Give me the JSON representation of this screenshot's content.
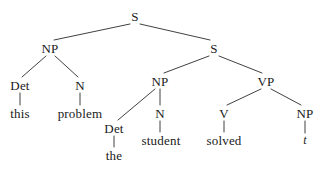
{
  "figure": {
    "type": "phrase-structure-tree",
    "sentence": "this problem the student solved t",
    "line_color": "#2b2b2b",
    "text_color": "#1a1a1a",
    "background_color": "#ffffff"
  },
  "nodes": [
    {
      "id": "s-root",
      "label": "S",
      "kind": "category",
      "x": 135,
      "y": 16
    },
    {
      "id": "np-topic",
      "label": "NP",
      "kind": "category",
      "x": 50,
      "y": 48
    },
    {
      "id": "s-embedded",
      "label": "S",
      "kind": "category",
      "x": 214,
      "y": 48
    },
    {
      "id": "det-this",
      "label": "Det",
      "kind": "category",
      "x": 20,
      "y": 85
    },
    {
      "id": "n-problem",
      "label": "N",
      "kind": "category",
      "x": 80,
      "y": 85
    },
    {
      "id": "np-subject",
      "label": "NP",
      "kind": "category",
      "x": 160,
      "y": 81
    },
    {
      "id": "vp",
      "label": "VP",
      "kind": "category",
      "x": 266,
      "y": 81
    },
    {
      "id": "w-this",
      "label": "this",
      "kind": "word",
      "x": 20,
      "y": 113
    },
    {
      "id": "w-problem",
      "label": "problem",
      "kind": "word",
      "x": 80,
      "y": 113
    },
    {
      "id": "n-student",
      "label": "N",
      "kind": "category",
      "x": 160,
      "y": 113
    },
    {
      "id": "v-solved",
      "label": "V",
      "kind": "category",
      "x": 224,
      "y": 113
    },
    {
      "id": "np-object",
      "label": "NP",
      "kind": "category",
      "x": 305,
      "y": 113
    },
    {
      "id": "det-the",
      "label": "Det",
      "kind": "category",
      "x": 114,
      "y": 128
    },
    {
      "id": "w-student",
      "label": "student",
      "kind": "word",
      "x": 161,
      "y": 140
    },
    {
      "id": "w-solved",
      "label": "solved",
      "kind": "word",
      "x": 224,
      "y": 140
    },
    {
      "id": "w-trace",
      "label": "t",
      "kind": "trace",
      "x": 305,
      "y": 140
    },
    {
      "id": "w-the",
      "label": "the",
      "kind": "word",
      "x": 114,
      "y": 155
    }
  ],
  "edges": [
    {
      "id": "e-root-np",
      "from": "s-root",
      "to": "np-topic",
      "x1": 130,
      "y1": 24,
      "x2": 54,
      "y2": 40
    },
    {
      "id": "e-root-s",
      "from": "s-root",
      "to": "s-embedded",
      "x1": 140,
      "y1": 24,
      "x2": 210,
      "y2": 40
    },
    {
      "id": "e-np-det",
      "from": "np-topic",
      "to": "det-this",
      "x1": 46,
      "y1": 56,
      "x2": 22,
      "y2": 77
    },
    {
      "id": "e-np-n",
      "from": "np-topic",
      "to": "n-problem",
      "x1": 55,
      "y1": 56,
      "x2": 78,
      "y2": 77
    },
    {
      "id": "e-det-this",
      "from": "det-this",
      "to": "w-this",
      "x1": 20,
      "y1": 93,
      "x2": 20,
      "y2": 105
    },
    {
      "id": "e-n-problem",
      "from": "n-problem",
      "to": "w-problem",
      "x1": 80,
      "y1": 93,
      "x2": 80,
      "y2": 105
    },
    {
      "id": "e-s-np",
      "from": "s-embedded",
      "to": "np-subject",
      "x1": 209,
      "y1": 56,
      "x2": 164,
      "y2": 73
    },
    {
      "id": "e-s-vp",
      "from": "s-embedded",
      "to": "vp",
      "x1": 219,
      "y1": 56,
      "x2": 262,
      "y2": 73
    },
    {
      "id": "e-npsubj-det",
      "from": "np-subject",
      "to": "det-the",
      "x1": 155,
      "y1": 89,
      "x2": 118,
      "y2": 120
    },
    {
      "id": "e-npsubj-n",
      "from": "np-subject",
      "to": "n-student",
      "x1": 160,
      "y1": 89,
      "x2": 160,
      "y2": 105
    },
    {
      "id": "e-det-the",
      "from": "det-the",
      "to": "w-the",
      "x1": 114,
      "y1": 136,
      "x2": 114,
      "y2": 147
    },
    {
      "id": "e-n-student",
      "from": "n-student",
      "to": "w-student",
      "x1": 160,
      "y1": 121,
      "x2": 160,
      "y2": 132
    },
    {
      "id": "e-vp-v",
      "from": "vp",
      "to": "v-solved",
      "x1": 261,
      "y1": 89,
      "x2": 227,
      "y2": 105
    },
    {
      "id": "e-vp-np",
      "from": "vp",
      "to": "np-object",
      "x1": 271,
      "y1": 89,
      "x2": 301,
      "y2": 105
    },
    {
      "id": "e-v-solved",
      "from": "v-solved",
      "to": "w-solved",
      "x1": 224,
      "y1": 121,
      "x2": 224,
      "y2": 132
    },
    {
      "id": "e-np-trace",
      "from": "np-object",
      "to": "w-trace",
      "x1": 305,
      "y1": 121,
      "x2": 305,
      "y2": 133
    }
  ]
}
